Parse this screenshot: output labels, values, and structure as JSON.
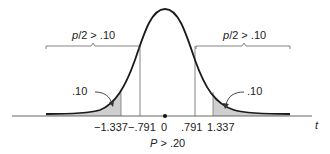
{
  "figure": {
    "type": "t-distribution two-tailed p-value illustration",
    "curve_color": "#1a1a1a",
    "shade_color": "#cccccc",
    "line_color": "#555555",
    "axis_label": "t",
    "ticks": [
      {
        "value": -1.337,
        "label": "−1.337"
      },
      {
        "value": -0.791,
        "label": "−.791"
      },
      {
        "value": 0,
        "label": "0"
      },
      {
        "value": 0.791,
        "label": ".791"
      },
      {
        "value": 1.337,
        "label": "1.337"
      }
    ],
    "left_brace_label_p": "p",
    "left_brace_label_rest": "/2 > .10",
    "right_brace_label_p": "p",
    "right_brace_label_rest": "/2 > .10",
    "left_tail_area": ".10",
    "right_tail_area": ".10",
    "bottom_label_p": "P",
    "bottom_label_rest": " > .20"
  }
}
